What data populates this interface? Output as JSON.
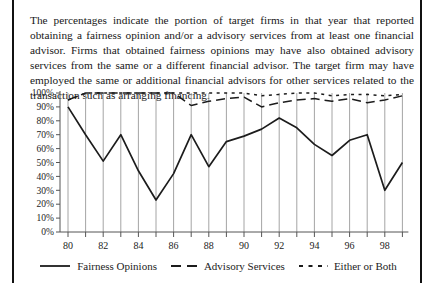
{
  "figure": {
    "description": "The percentages indicate the portion of target firms in that year that reported obtaining a fairness opinion and/or a advisory services from at least one financial advisor. Firms that obtained fairness opinions may have also obtained advisory services from the same or a different financial advisor. The target firm may have employed the same or additional financial advisors for other services related to the transaction such as arranging financing."
  },
  "chart_data": {
    "type": "line",
    "x": [
      1980,
      1981,
      1982,
      1983,
      1984,
      1985,
      1986,
      1987,
      1988,
      1989,
      1990,
      1991,
      1992,
      1993,
      1994,
      1995,
      1996,
      1997,
      1998,
      1999
    ],
    "x_tick_labels": [
      "80",
      "82",
      "84",
      "86",
      "88",
      "90",
      "92",
      "94",
      "96",
      "98"
    ],
    "y_tick_labels": [
      "0%",
      "10%",
      "20%",
      "30%",
      "40%",
      "50%",
      "60%",
      "70%",
      "80%",
      "90%",
      "100%"
    ],
    "ylim": [
      0,
      100
    ],
    "grid": "vertical-per-year",
    "legend_position": "bottom",
    "series": [
      {
        "name": "Fairness Opinions",
        "style": "solid",
        "values": [
          90,
          70,
          51,
          70,
          44,
          23,
          42,
          70,
          47,
          65,
          69,
          74,
          82,
          75,
          63,
          55,
          66,
          70,
          30,
          50
        ]
      },
      {
        "name": "Advisory Services",
        "style": "long-dash",
        "values": [
          95,
          100,
          100,
          100,
          100,
          100,
          100,
          91,
          94,
          96,
          97,
          90,
          93,
          95,
          96,
          94,
          96,
          93,
          95,
          98
        ]
      },
      {
        "name": "Either or Both",
        "style": "short-dash",
        "values": [
          95,
          100,
          100,
          100,
          100,
          100,
          100,
          100,
          100,
          100,
          100,
          98,
          99,
          100,
          100,
          98,
          99,
          99,
          98,
          99
        ]
      }
    ],
    "colors": {
      "line": "#1c1c1c",
      "grid": "#9a9a9a",
      "axis": "#555555"
    }
  }
}
